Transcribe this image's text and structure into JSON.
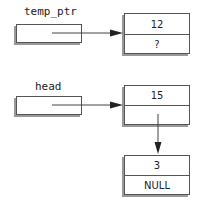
{
  "diagram": {
    "top": {
      "pointer_label": "temp_ptr",
      "node": {
        "data": "12",
        "next": "?"
      }
    },
    "bottom": {
      "pointer_label": "head",
      "node1": {
        "data": "15",
        "next": ""
      },
      "node2": {
        "data": "3",
        "next": "NULL"
      }
    }
  }
}
